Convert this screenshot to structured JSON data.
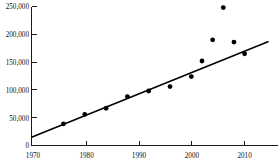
{
  "chart_data": {
    "type": "scatter",
    "title": "",
    "xlabel": "",
    "ylabel": "",
    "xlim": [
      1970,
      2015
    ],
    "ylim": [
      0,
      250000
    ],
    "grid": false,
    "legend": null,
    "x_ticks": [
      1970,
      1980,
      1990,
      2000,
      2010
    ],
    "x_tick_labels": [
      "1970",
      "1980",
      "1990",
      "2000",
      "2010"
    ],
    "y_ticks": [
      0,
      50000,
      100000,
      150000,
      200000,
      250000
    ],
    "y_tick_labels": [
      "0",
      "50,000",
      "100,000",
      "150,000",
      "200,000",
      "250,000"
    ],
    "series": [
      {
        "name": "observations",
        "marker": "filled-circle",
        "color": "#000000",
        "points": [
          {
            "x": 1976,
            "y": 39000
          },
          {
            "x": 1980,
            "y": 56000
          },
          {
            "x": 1984,
            "y": 67000
          },
          {
            "x": 1988,
            "y": 88000
          },
          {
            "x": 1992,
            "y": 98000
          },
          {
            "x": 1996,
            "y": 106000
          },
          {
            "x": 2000,
            "y": 124000
          },
          {
            "x": 2002,
            "y": 152000
          },
          {
            "x": 2004,
            "y": 190000
          },
          {
            "x": 2006,
            "y": 248000
          },
          {
            "x": 2008,
            "y": 186000
          },
          {
            "x": 2010,
            "y": 165000
          }
        ]
      }
    ],
    "trend_line": {
      "name": "linear fit",
      "color": "#000000",
      "x_start": 1970,
      "y_start": 15000,
      "x_end": 2014.5,
      "y_end": 187000
    }
  },
  "axis_color": "#1a1a1a",
  "background_color": "#ffffff"
}
